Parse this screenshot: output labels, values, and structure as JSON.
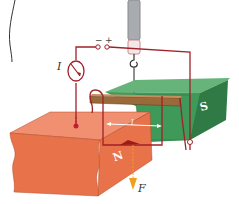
{
  "diagram": {
    "title": "",
    "labels": {
      "current": "I",
      "force": "F",
      "length": "l",
      "north_pole": "N",
      "south_pole": "S",
      "minus": "−",
      "plus": "+"
    },
    "colors": {
      "north_magnet": "#e8734a",
      "north_magnet_dark": "#d05a34",
      "north_magnet_top": "#f09070",
      "south_magnet": "#3f9a5a",
      "south_magnet_dark": "#2f7a45",
      "south_magnet_top": "#66b47a",
      "wire": "#a0212a",
      "rod": "#9a6a3a",
      "force_arrow": "#f0a020",
      "spring_scale": "#b0b4b8"
    }
  }
}
